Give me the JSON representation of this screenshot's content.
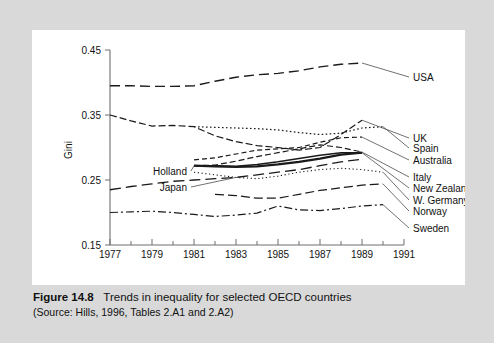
{
  "caption": {
    "figure_number": "Figure 14.8",
    "title": "Trends in inequality for selected OECD countries",
    "source": "(Source: Hills, 1996, Tables 2.A1 and 2.A2)"
  },
  "chart_data": {
    "type": "line",
    "title": "Trends in inequality for selected OECD countries",
    "xlabel": "",
    "ylabel": "Gini",
    "xlim": [
      1977,
      1991
    ],
    "ylim": [
      0.15,
      0.45
    ],
    "yticks": [
      "0.15",
      "0.25",
      "0.35",
      "0.45"
    ],
    "ytick_values": [
      0.15,
      0.25,
      0.35,
      0.45
    ],
    "xticks": [
      "1977",
      "1979",
      "1981",
      "1983",
      "1985",
      "1987",
      "1989",
      "1991"
    ],
    "xtick_values": [
      1977,
      1979,
      1981,
      1983,
      1985,
      1987,
      1989,
      1991
    ],
    "minor_xticks": [
      1978,
      1980,
      1982,
      1984,
      1986,
      1988,
      1990
    ],
    "grid": false,
    "legend": "inline-labels",
    "series": [
      {
        "name": "USA",
        "label_side": "right",
        "dash": "10 5",
        "width": 1.4,
        "x": [
          1977,
          1978,
          1979,
          1980,
          1981,
          1982,
          1983,
          1984,
          1985,
          1986,
          1987,
          1988,
          1989
        ],
        "values": [
          0.395,
          0.395,
          0.394,
          0.394,
          0.395,
          0.402,
          0.408,
          0.412,
          0.414,
          0.418,
          0.424,
          0.428,
          0.43
        ]
      },
      {
        "name": "UK",
        "label_side": "right",
        "dash": "7 3",
        "width": 1.2,
        "x": [
          1977,
          1978,
          1979,
          1980,
          1981,
          1982,
          1983,
          1984,
          1985,
          1986,
          1987,
          1988,
          1989
        ],
        "values": [
          0.35,
          0.341,
          0.333,
          0.334,
          0.332,
          0.318,
          0.309,
          0.303,
          0.3,
          0.296,
          0.3,
          0.32,
          0.342
        ]
      },
      {
        "name": "Spain",
        "label_side": "right",
        "dash": "1.6 2.4",
        "width": 1.2,
        "x": [
          1981,
          1982,
          1983,
          1984,
          1985,
          1986,
          1987,
          1988,
          1989,
          1990
        ],
        "values": [
          0.332,
          0.331,
          0.33,
          0.329,
          0.327,
          0.323,
          0.32,
          0.322,
          0.33,
          0.332
        ]
      },
      {
        "name": "Australia",
        "label_side": "right",
        "dash": "5 3",
        "width": 1.2,
        "x": [
          1981,
          1982,
          1983,
          1984,
          1985,
          1986,
          1987,
          1988,
          1989
        ],
        "values": [
          0.281,
          0.284,
          0.29,
          0.296,
          0.298,
          0.3,
          0.308,
          0.315,
          0.316
        ]
      },
      {
        "name": "Italy",
        "label_side": "right",
        "dash": "6 3",
        "width": 1.2,
        "x": [
          1981,
          1982,
          1983,
          1984,
          1985,
          1986,
          1987,
          1988,
          1989
        ],
        "values": [
          0.272,
          0.273,
          0.279,
          0.286,
          0.292,
          0.298,
          0.304,
          0.3,
          0.293
        ]
      },
      {
        "name": "New Zealand",
        "label_side": "right",
        "dash": "",
        "width": 1.5,
        "x": [
          1981,
          1982,
          1983,
          1984,
          1985,
          1986,
          1987,
          1988,
          1989
        ],
        "values": [
          0.272,
          0.272,
          0.271,
          0.274,
          0.278,
          0.283,
          0.288,
          0.292,
          0.292
        ]
      },
      {
        "name": "W. Germany",
        "label_side": "right",
        "dash": "1.2 2.6",
        "width": 1.1,
        "x": [
          1981,
          1982,
          1983,
          1984,
          1985,
          1986,
          1987,
          1988,
          1989,
          1990
        ],
        "values": [
          0.262,
          0.258,
          0.254,
          0.252,
          0.256,
          0.262,
          0.266,
          0.268,
          0.266,
          0.262
        ]
      },
      {
        "name": "Norway",
        "label_side": "right",
        "dash": "9 4",
        "width": 1.2,
        "x": [
          1982,
          1983,
          1984,
          1985,
          1986,
          1987,
          1988,
          1989,
          1990
        ],
        "values": [
          0.228,
          0.226,
          0.222,
          0.222,
          0.228,
          0.234,
          0.238,
          0.242,
          0.244
        ]
      },
      {
        "name": "Sweden",
        "label_side": "right",
        "dash": "8 3 2 3",
        "width": 1.2,
        "x": [
          1977,
          1978,
          1979,
          1980,
          1981,
          1982,
          1983,
          1984,
          1985,
          1986,
          1987,
          1988,
          1989,
          1990
        ],
        "values": [
          0.2,
          0.201,
          0.202,
          0.2,
          0.197,
          0.194,
          0.196,
          0.199,
          0.21,
          0.204,
          0.203,
          0.206,
          0.21,
          0.212
        ]
      },
      {
        "name": "Holland",
        "label_side": "inline-left",
        "dash": "",
        "width": 2.2,
        "x": [
          1981,
          1982,
          1983,
          1984,
          1985,
          1986,
          1987,
          1988,
          1989
        ],
        "values": [
          0.272,
          0.271,
          0.27,
          0.271,
          0.274,
          0.278,
          0.283,
          0.289,
          0.292
        ]
      },
      {
        "name": "Japan",
        "label_side": "inline-left",
        "dash": "11 5",
        "width": 1.3,
        "x": [
          1977,
          1978,
          1979,
          1980,
          1981,
          1982,
          1983,
          1984,
          1985,
          1986,
          1987,
          1988,
          1989
        ],
        "values": [
          0.235,
          0.24,
          0.244,
          0.248,
          0.25,
          0.252,
          0.254,
          0.258,
          0.262,
          0.266,
          0.272,
          0.278,
          0.282
        ]
      }
    ]
  }
}
